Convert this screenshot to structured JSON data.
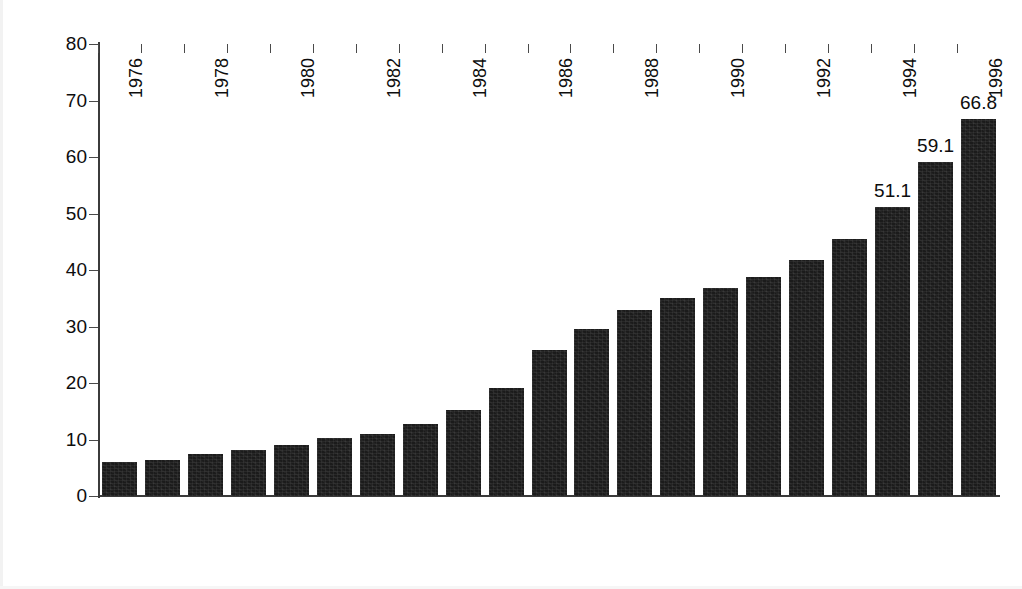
{
  "chart_data": {
    "type": "bar",
    "title": "",
    "xlabel": "",
    "ylabel": "Millions of Enrollees",
    "ylim": [
      0,
      80
    ],
    "yticks": [
      0,
      10,
      20,
      30,
      40,
      50,
      60,
      70,
      80
    ],
    "ytick_labels": [
      "0",
      "10",
      "20",
      "30",
      "40",
      "50",
      "60",
      "70",
      "80"
    ],
    "grid": false,
    "legend": "none",
    "bar_color": "#1b1b1b",
    "categories": [
      "1976",
      "1977",
      "1978",
      "1979",
      "1980",
      "1981",
      "1982",
      "1983",
      "1984",
      "1985",
      "1986",
      "1987",
      "1988",
      "1989",
      "1990",
      "1991",
      "1992",
      "1993",
      "1994",
      "1995",
      "1996"
    ],
    "xtick_labels_shown": [
      "1976",
      "",
      "1978",
      "",
      "1980",
      "",
      "1982",
      "",
      "1984",
      "",
      "1986",
      "",
      "1988",
      "",
      "1990",
      "",
      "1992",
      "",
      "1994",
      "",
      "1996"
    ],
    "values": [
      6.0,
      6.3,
      7.5,
      8.2,
      9.1,
      10.3,
      11.0,
      12.8,
      15.2,
      19.1,
      25.8,
      29.6,
      33.0,
      35.0,
      36.8,
      38.7,
      41.7,
      45.5,
      51.1,
      59.1,
      66.8
    ],
    "value_labels": [
      "",
      "",
      "",
      "",
      "",
      "",
      "",
      "",
      "",
      "",
      "",
      "",
      "",
      "",
      "",
      "",
      "",
      "",
      "51.1",
      "59.1",
      "66.8"
    ]
  }
}
